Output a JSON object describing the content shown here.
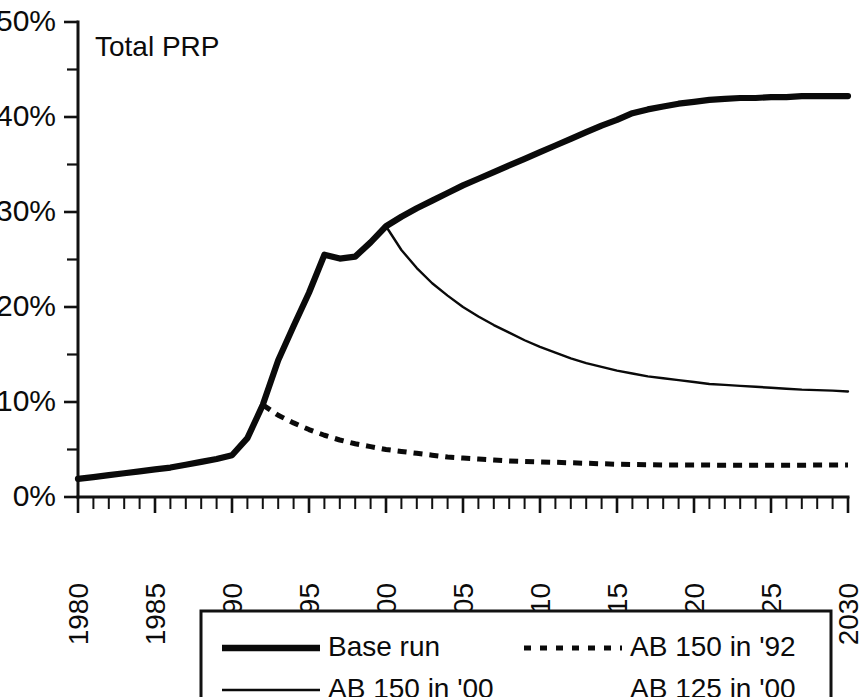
{
  "chart_data": {
    "type": "line",
    "title": "Total PRP",
    "xlabel": "",
    "ylabel": "",
    "grid": false,
    "xlim": [
      1980,
      2030
    ],
    "ylim": [
      0,
      50
    ],
    "y_unit": "%",
    "x_tick_labels": [
      "1980",
      "1985",
      "1990",
      "1995",
      "2000",
      "2005",
      "2010",
      "2015",
      "2020",
      "2025",
      "2030"
    ],
    "x_tick_values": [
      1980,
      1985,
      1990,
      1995,
      2000,
      2005,
      2010,
      2015,
      2020,
      2025,
      2030
    ],
    "x_minor_tick_step": 1,
    "y_tick_labels": [
      "0%",
      "10%",
      "20%",
      "30%",
      "40%",
      "50%"
    ],
    "y_tick_values": [
      0,
      10,
      20,
      30,
      40,
      50
    ],
    "y_minor_tick_values": [
      5,
      15,
      25,
      35,
      45
    ],
    "legend_position": "below-chart",
    "series": [
      {
        "name": "Base run",
        "style": "thick-solid",
        "x": [
          1980,
          1981,
          1982,
          1983,
          1984,
          1985,
          1986,
          1987,
          1988,
          1989,
          1990,
          1991,
          1992,
          1993,
          1994,
          1995,
          1996,
          1997,
          1998,
          1999,
          2000,
          2001,
          2002,
          2003,
          2004,
          2005,
          2006,
          2007,
          2008,
          2009,
          2010,
          2011,
          2012,
          2013,
          2014,
          2015,
          2016,
          2017,
          2018,
          2019,
          2020,
          2021,
          2022,
          2023,
          2024,
          2025,
          2026,
          2027,
          2028,
          2029,
          2030
        ],
        "values": [
          1.9,
          2.1,
          2.3,
          2.5,
          2.7,
          2.9,
          3.1,
          3.4,
          3.7,
          4.0,
          4.4,
          6.2,
          9.7,
          14.4,
          18.0,
          21.5,
          25.5,
          25.1,
          25.3,
          26.8,
          28.5,
          29.5,
          30.4,
          31.2,
          32.0,
          32.8,
          33.5,
          34.2,
          34.9,
          35.6,
          36.3,
          37.0,
          37.7,
          38.4,
          39.1,
          39.7,
          40.4,
          40.8,
          41.1,
          41.4,
          41.6,
          41.8,
          41.9,
          42.0,
          42.0,
          42.1,
          42.1,
          42.2,
          42.2,
          42.2,
          42.2
        ]
      },
      {
        "name": "AB 150 in '92",
        "style": "dotted",
        "x": [
          1992,
          1993,
          1994,
          1995,
          1996,
          1997,
          1998,
          1999,
          2000,
          2001,
          2002,
          2003,
          2004,
          2005,
          2006,
          2007,
          2008,
          2009,
          2010,
          2011,
          2012,
          2013,
          2014,
          2015,
          2016,
          2017,
          2018,
          2019,
          2020,
          2021,
          2022,
          2023,
          2024,
          2025,
          2026,
          2027,
          2028,
          2029,
          2030
        ],
        "values": [
          9.7,
          8.6,
          7.8,
          7.1,
          6.5,
          6.0,
          5.6,
          5.3,
          5.0,
          4.8,
          4.6,
          4.4,
          4.2,
          4.1,
          4.0,
          3.9,
          3.8,
          3.75,
          3.7,
          3.65,
          3.6,
          3.55,
          3.5,
          3.45,
          3.42,
          3.4,
          3.38,
          3.37,
          3.36,
          3.36,
          3.35,
          3.35,
          3.35,
          3.35,
          3.35,
          3.35,
          3.36,
          3.36,
          3.37
        ]
      },
      {
        "name": "AB 150 in '00",
        "style": "thin-solid",
        "x": [
          2000,
          2001,
          2002,
          2003,
          2004,
          2005,
          2006,
          2007,
          2008,
          2009,
          2010,
          2011,
          2012,
          2013,
          2014,
          2015,
          2016,
          2017,
          2018,
          2019,
          2020,
          2021,
          2022,
          2023,
          2024,
          2025,
          2026,
          2027,
          2028,
          2029,
          2030
        ],
        "values": [
          28.5,
          26.0,
          24.1,
          22.5,
          21.2,
          20.0,
          19.0,
          18.1,
          17.3,
          16.5,
          15.8,
          15.2,
          14.6,
          14.1,
          13.7,
          13.3,
          13.0,
          12.7,
          12.5,
          12.3,
          12.1,
          11.9,
          11.8,
          11.7,
          11.6,
          11.5,
          11.4,
          11.3,
          11.25,
          11.2,
          11.1
        ]
      },
      {
        "name": "AB 125 in '00",
        "style": "none",
        "x": [],
        "values": []
      }
    ]
  },
  "legend": {
    "entries": [
      {
        "label": "Base run",
        "style": "thick-solid"
      },
      {
        "label": "AB 150 in '92",
        "style": "dotted"
      },
      {
        "label": "AB 150 in '00",
        "style": "thin-solid"
      },
      {
        "label": "AB 125 in '00",
        "style": "none"
      }
    ]
  },
  "colors": {
    "ink": "#0a0a0a",
    "background": "#ffffff"
  }
}
